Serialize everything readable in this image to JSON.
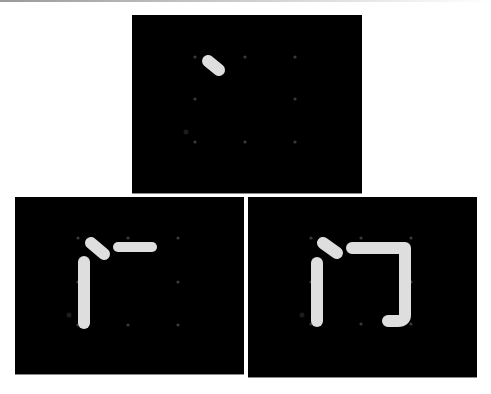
{
  "figure": {
    "character": "门",
    "stroke_color": "#dedede",
    "grid_dot_color": "#3a3a3a",
    "background": "#000000"
  },
  "panels": [
    {
      "id": "step-1",
      "strokes_shown": 1,
      "box": {
        "x": 132,
        "y": 15,
        "w": 230,
        "h": 178
      },
      "grid_dots": [
        [
          63,
          42
        ],
        [
          113,
          42
        ],
        [
          163,
          42
        ],
        [
          63,
          84
        ],
        [
          163,
          84
        ],
        [
          63,
          127
        ],
        [
          113,
          127
        ],
        [
          163,
          127
        ]
      ],
      "faint_mark": [
        54,
        117
      ],
      "strokes": [
        {
          "name": "dot",
          "path": "M76 46 L87 55",
          "width": 12
        }
      ]
    },
    {
      "id": "step-2",
      "strokes_shown": 3,
      "box": {
        "x": 15,
        "y": 197,
        "w": 229,
        "h": 177
      },
      "grid_dots": [
        [
          63,
          41
        ],
        [
          113,
          41
        ],
        [
          163,
          41
        ],
        [
          63,
          85
        ],
        [
          163,
          85
        ],
        [
          63,
          128
        ],
        [
          113,
          128
        ],
        [
          163,
          128
        ]
      ],
      "faint_mark": [
        54,
        118
      ],
      "strokes": [
        {
          "name": "dot",
          "path": "M76 46 L89 57",
          "width": 12
        },
        {
          "name": "vertical",
          "path": "M69 65 L69 126",
          "width": 12
        },
        {
          "name": "horizontal",
          "path": "M103 50 L137 50",
          "width": 10
        }
      ]
    },
    {
      "id": "step-3",
      "strokes_shown": 4,
      "box": {
        "x": 248,
        "y": 197,
        "w": 229,
        "h": 180
      },
      "grid_dots": [
        [
          63,
          41
        ],
        [
          113,
          41
        ],
        [
          163,
          41
        ],
        [
          63,
          85
        ],
        [
          163,
          85
        ],
        [
          63,
          127
        ],
        [
          113,
          127
        ],
        [
          163,
          127
        ]
      ],
      "faint_mark": [
        54,
        118
      ],
      "strokes": [
        {
          "name": "dot",
          "path": "M75 46 L89 56",
          "width": 12
        },
        {
          "name": "vertical",
          "path": "M69 66 L69 124",
          "width": 12
        },
        {
          "name": "horizontal-turn-hook",
          "path": "M104 51 L157 51 L157 118 Q157 124 150 124 L140 124",
          "width": 12
        }
      ]
    }
  ]
}
